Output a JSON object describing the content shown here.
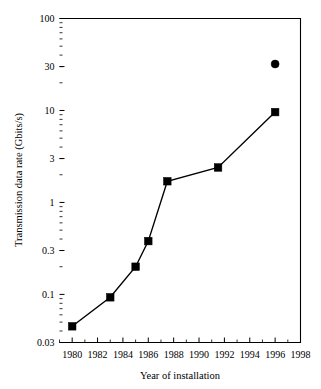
{
  "chart_data": {
    "type": "scatter",
    "title": "",
    "xlabel": "Year of installation",
    "ylabel": "Transmission data rate (Gbits/s)",
    "xlim": [
      1979,
      1998
    ],
    "ylim": [
      0.03,
      100
    ],
    "yscale": "log",
    "xscale": "linear",
    "grid": false,
    "legend": "none",
    "xticks": [
      1980,
      1982,
      1984,
      1986,
      1988,
      1990,
      1992,
      1994,
      1996,
      1998
    ],
    "xtick_labels": [
      "1980",
      "1982",
      "1984",
      "1986",
      "1988",
      "1990",
      "1992",
      "1994",
      "1996",
      "1998"
    ],
    "yticks": [
      0.03,
      0.1,
      0.3,
      1,
      3,
      10,
      30,
      100
    ],
    "ytick_labels": [
      "0.03",
      "0.1",
      "0.3",
      "1",
      "3",
      "10",
      "30",
      "100"
    ],
    "series": [
      {
        "name": "Installed systems",
        "marker": "square",
        "connected": true,
        "x": [
          1980,
          1983,
          1985,
          1986,
          1987.5,
          1991.5,
          1996
        ],
        "values": [
          0.045,
          0.093,
          0.2,
          0.38,
          1.7,
          2.4,
          9.6
        ]
      },
      {
        "name": "Outlier point",
        "marker": "circle",
        "connected": false,
        "x": [
          1996
        ],
        "values": [
          32
        ]
      }
    ]
  },
  "colors": {
    "ink": "#000000",
    "background": "#ffffff"
  }
}
